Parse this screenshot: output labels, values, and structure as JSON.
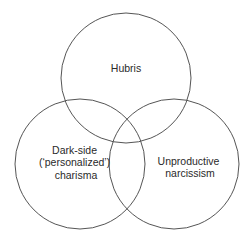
{
  "diagram": {
    "type": "venn",
    "sets": [
      {
        "id": "hubris",
        "label_lines": [
          "Hubris"
        ],
        "circle": {
          "cx": 126,
          "cy": 78,
          "r": 65
        },
        "label_pos": {
          "x": 126,
          "y": 72
        }
      },
      {
        "id": "dark-side-charisma",
        "label_lines": [
          "Dark-side",
          "(‘personalized’)",
          "charisma"
        ],
        "circle": {
          "cx": 80,
          "cy": 164,
          "r": 65
        },
        "label_pos": {
          "x": 76,
          "y": 166
        }
      },
      {
        "id": "unproductive-narcissism",
        "label_lines": [
          "Unproductive",
          "narcissism"
        ],
        "circle": {
          "cx": 174,
          "cy": 164,
          "r": 65
        },
        "label_pos": {
          "x": 190,
          "y": 171
        }
      }
    ],
    "stroke_color": "#555555",
    "text_color": "#2a2a2a",
    "background": "#ffffff"
  }
}
